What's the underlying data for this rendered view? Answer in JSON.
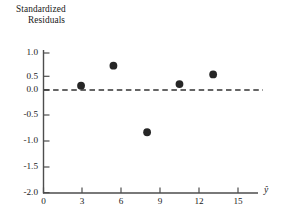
{
  "chart_data": {
    "type": "scatter",
    "title": "",
    "ylabel_line1": "Standardized",
    "ylabel_line2": "Residuals",
    "xlabel": "ŷ",
    "xlim": [
      0,
      16.2
    ],
    "ylim": [
      -2.0,
      1.25
    ],
    "grid": false,
    "legend": null,
    "x_ticks": [
      0,
      3,
      6,
      9,
      12,
      15
    ],
    "x_tick_labels": [
      "0",
      "3",
      "6",
      "9",
      "12",
      "15"
    ],
    "y_ticks": [
      1.0,
      0.5,
      0.0,
      -0.5,
      -1.0,
      -1.5,
      -2.0
    ],
    "y_tick_labels": [
      "1.0",
      "0.5",
      "0.0",
      "-0.5",
      "-1.0",
      "-1.5",
      "-2.0"
    ],
    "x": [
      2.9,
      5.4,
      8.0,
      10.5,
      13.1
    ],
    "y": [
      0.17,
      0.95,
      -1.65,
      0.23,
      0.61
    ],
    "points": [
      {
        "x": 2.9,
        "y": 0.17
      },
      {
        "x": 5.4,
        "y": 0.95
      },
      {
        "x": 8.0,
        "y": -1.65
      },
      {
        "x": 10.5,
        "y": 0.23
      },
      {
        "x": 13.1,
        "y": 0.61
      }
    ],
    "reference_line": {
      "y": 0.0,
      "style": "dashed"
    },
    "marker": "filled-circle",
    "colors": {
      "marker": "#262626",
      "axis": "#4d4d4d",
      "reference_line": "#333333",
      "text": "#1a1a1a",
      "background": "#ffffff"
    }
  }
}
